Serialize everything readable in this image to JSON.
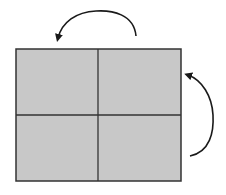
{
  "diagram": {
    "type": "rotation-fold-diagram",
    "colors": {
      "background": "#ffffff",
      "panel_fill": "#c8c8c8",
      "stroke": "#333333",
      "arrow": "#1a1a1a"
    },
    "grid": {
      "rows": 2,
      "cols": 2,
      "x": 16,
      "y": 49,
      "width": 165,
      "height": 132,
      "divider_x": 98,
      "divider_y": 115
    },
    "panels": [
      {
        "id": "top-left",
        "row": 0,
        "col": 0
      },
      {
        "id": "top-right",
        "row": 0,
        "col": 1
      },
      {
        "id": "bottom-left",
        "row": 1,
        "col": 0
      },
      {
        "id": "bottom-right",
        "row": 1,
        "col": 1
      }
    ],
    "arrows": [
      {
        "id": "top-arrow",
        "direction": "counter-clockwise",
        "from": [
          136,
          36
        ],
        "to": [
          57,
          40
        ],
        "description": "curved arrow above the grid pointing left"
      },
      {
        "id": "right-arrow",
        "direction": "counter-clockwise",
        "from": [
          190,
          156
        ],
        "to": [
          186,
          75
        ],
        "description": "curved arrow right of the grid pointing up"
      }
    ]
  }
}
